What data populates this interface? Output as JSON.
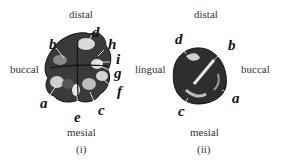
{
  "figure_i": {
    "caption": "(i)",
    "directions": {
      "top": "distal",
      "bottom": "mesial",
      "left": "buccal",
      "right": "lingual"
    },
    "labels": [
      "a",
      "b",
      "c",
      "d",
      "e",
      "f",
      "g",
      "h",
      "i"
    ]
  },
  "figure_ii": {
    "caption": "(ii)",
    "directions": {
      "top": "distal",
      "bottom": "mesial",
      "left": "lingual",
      "right": "buccal"
    },
    "labels": [
      "a",
      "b",
      "c",
      "d"
    ]
  }
}
